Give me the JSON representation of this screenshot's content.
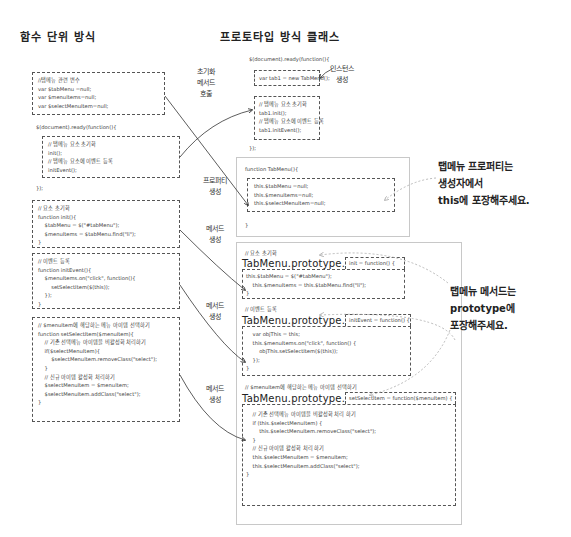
{
  "titles": {
    "left": "함수 단위 방식",
    "right": "프로토타입 방식 클래스"
  },
  "left": {
    "vars_box": [
      "//탭메뉴 관련 변수",
      "var $tabMenu =null;",
      "var $menuItems=null;",
      "var $selectMenuItem=null;"
    ],
    "ready_open": "$(document).ready(function(){",
    "ready_box": [
      "// 탭메뉴 요소 초기화",
      "init();",
      "// 탭메뉴 요소에 이벤트 등록",
      "initEvent();"
    ],
    "ready_close": "});",
    "init_box": [
      "// 요소 초기화",
      "function init(){",
      "    $tabMenu = $(\"#tabMenu\");",
      "    $menuItems = $tabMenu.find(\"li\");",
      "}"
    ],
    "initevent_box": [
      "// 이벤트 등록",
      "function initEvent(){",
      "    $menuItems.on(\"click\", function(){",
      "        setSelectItem($(this));",
      "    });",
      "}"
    ],
    "select_box": [
      "// $menuItem에 해당하는 메뉴 아이템 선택하기",
      "function setSelectItem($menuItem){",
      "    // 기존 선택메뉴 아이템을 비활성화 처리하기",
      "    if($selectMenuItem){",
      "        $selectMenuItem.removeClass(\"select\");",
      "    }",
      "",
      "    // 신규 아이템 활성화 처리하기",
      "    $selectMenuItem = $menuItem;",
      "    $selectMenuItem.addClass(\"select\");",
      "}"
    ]
  },
  "labels": {
    "call_init": [
      "초기화",
      "메서드",
      "호출"
    ],
    "instance": [
      "인스턴스",
      "생성"
    ],
    "property": [
      "프로퍼티",
      "생성"
    ],
    "method1": [
      "메서드",
      "생성"
    ],
    "method2": [
      "메서드",
      "생성"
    ],
    "method3": [
      "메서드",
      "생성"
    ]
  },
  "right": {
    "ready_open": "$(document).ready(function(){",
    "new_box": "var tab1 = new TabMenu();",
    "call_box": [
      "// 탭메뉴 요소 초기화",
      "tab1.init();",
      "// 탭메뉴 요소에 이벤트 등록",
      "tab1.initEvent();"
    ],
    "ready_close": "});",
    "ctor_open": "function TabMenu(){",
    "ctor_box": [
      "this.$tabMenu =null;",
      "this.$menuItems=null;",
      "this.$selectMenuItem=null;"
    ],
    "ctor_close": "}",
    "m1_comment": "// 요소 초기화",
    "m1_proto": "TabMenu.prototype.",
    "m1_sig": "init = function() {",
    "m1_body": [
      "this.$tabMenu = $(\"#tabMenu\");",
      "    this.$menuItems = this.$tabMenu.find(\"li\");",
      "}"
    ],
    "m2_comment": "// 이벤트 등록",
    "m2_proto": "TabMenu.prototype.",
    "m2_sig": "initEvent = function() {",
    "m2_body": [
      "    var objThis = this;",
      "    this.$menuItems.on(\"click\", function() {",
      "        objThis.setSelectItem($(this));",
      "    });",
      "}"
    ],
    "m3_comment": "// $menuItem에 해당하는 메뉴 아이템 선택하기",
    "m3_proto": "TabMenu.prototype.",
    "m3_sig": "setSelectItem = function($menuItem) {",
    "m3_body": [
      "    // 기존 선택메뉴 아이템을 비활성화 처리 하기",
      "    if (this.$selectMenuItem) {",
      "        this.$selectMenuItem.removeClass(\"select\");",
      "    }",
      "",
      "    // 신규 아이템 활성화 처리 하기",
      "    this.$selectMenuItem = $menuItem;",
      "    this.$selectMenuItem.addClass(\"select\");",
      "}"
    ]
  },
  "notes": {
    "property_note": [
      "탭메뉴 프로퍼티는",
      "생성자에서",
      "this에 포장해주세요."
    ],
    "method_note": [
      "탭메뉴 메서드는",
      "prototype에",
      "포장해주세요."
    ]
  }
}
